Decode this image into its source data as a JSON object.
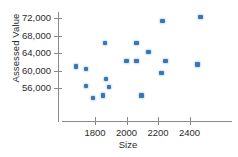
{
  "chart_data": {
    "type": "scatter",
    "title": "",
    "xlabel": "Size",
    "ylabel": "Assessed Value",
    "xlim": [
      1660,
      2520
    ],
    "ylim": [
      53200,
      73400
    ],
    "xticks": [
      1800,
      2000,
      2200,
      2400
    ],
    "xtick_labels": [
      "1800",
      "2000",
      "2200",
      "2400"
    ],
    "yticks": [
      56000,
      60000,
      64000,
      68000,
      72000
    ],
    "ytick_labels": [
      "56,000",
      "60,000",
      "64,000",
      "68,000",
      "72,000"
    ],
    "grid": false,
    "legend": null,
    "marker_color": "#3a77b0",
    "axis_color": "#8a8a86",
    "series": [
      {
        "name": "Homes",
        "points": [
          {
            "x": 1679,
            "y": 60900
          },
          {
            "x": 1743,
            "y": 56500
          },
          {
            "x": 1743,
            "y": 60300
          },
          {
            "x": 1787,
            "y": 53700
          },
          {
            "x": 1851,
            "y": 54300
          },
          {
            "x": 1863,
            "y": 66300
          },
          {
            "x": 1870,
            "y": 58100
          },
          {
            "x": 1889,
            "y": 56300
          },
          {
            "x": 2000,
            "y": 62200
          },
          {
            "x": 2064,
            "y": 62200
          },
          {
            "x": 2064,
            "y": 66300
          },
          {
            "x": 2095,
            "y": 54300
          },
          {
            "x": 2140,
            "y": 64300
          },
          {
            "x": 2222,
            "y": 59400
          },
          {
            "x": 2229,
            "y": 71300
          },
          {
            "x": 2248,
            "y": 62200
          },
          {
            "x": 2451,
            "y": 61400
          },
          {
            "x": 2470,
            "y": 72300
          }
        ]
      }
    ]
  }
}
